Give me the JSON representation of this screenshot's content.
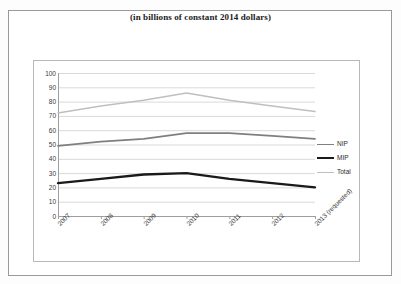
{
  "chart_title": "(in billions of constant 2014 dollars)",
  "legend": {
    "position": "right",
    "items": [
      {
        "label": "NIP",
        "color": "#7f7f7f",
        "width": 1.8
      },
      {
        "label": "MIP",
        "color": "#1a1a1a",
        "width": 2.4
      },
      {
        "label": "Total",
        "color": "#bfbfbf",
        "width": 1.6
      }
    ]
  },
  "axes": {
    "y_ticks": [
      100,
      90,
      80,
      70,
      60,
      50,
      40,
      30,
      20,
      10,
      0
    ],
    "x_ticks": [
      "2007",
      "2008",
      "2009",
      "2010",
      "2011",
      "2012",
      "2013 (requested)"
    ]
  },
  "chart_data": {
    "type": "line",
    "title": "(in billions of constant 2014 dollars)",
    "xlabel": "",
    "ylabel": "",
    "ylim": [
      0,
      100
    ],
    "ytick_step": 10,
    "grid": true,
    "legend_position": "right",
    "categories": [
      "2007",
      "2008",
      "2009",
      "2010",
      "2011",
      "2012",
      "2013 (requested)"
    ],
    "series": [
      {
        "name": "NIP",
        "color": "#7f7f7f",
        "values": [
          49,
          52,
          54,
          58,
          58,
          56,
          54
        ]
      },
      {
        "name": "MIP",
        "color": "#1a1a1a",
        "values": [
          23,
          26,
          29,
          30,
          26,
          23,
          20
        ]
      },
      {
        "name": "Total",
        "color": "#bfbfbf",
        "values": [
          72,
          77,
          81,
          86,
          81,
          77,
          73
        ]
      }
    ]
  }
}
